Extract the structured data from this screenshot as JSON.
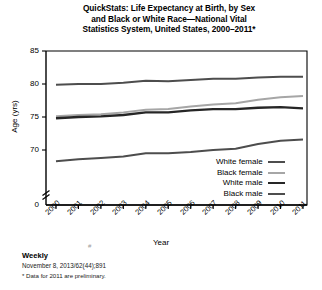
{
  "title": {
    "lines": [
      "QuickStats: Life Expectancy at Birth, by Sex",
      "and Black or White Race—National Vital",
      "Statistics System, United States, 2000–2011*"
    ]
  },
  "footer": {
    "weekly": "Weekly",
    "citation": "November 8, 2013/62(44);891",
    "note": "* Data for 2011 are preliminary."
  },
  "chart_data": {
    "type": "line",
    "title": "QuickStats: Life Expectancy at Birth, by Sex and Black or White Race—National Vital Statistics System, United States, 2000–2011*",
    "xlabel": "Year",
    "ylabel": "Age (yrs)",
    "categories": [
      "2000",
      "2001",
      "2002",
      "2003",
      "2004",
      "2005",
      "2006",
      "2007",
      "2008",
      "2009",
      "2010",
      "2011"
    ],
    "yticks": [
      "0",
      "70",
      "75",
      "80",
      "85"
    ],
    "ylim": [
      66.5,
      85
    ],
    "y_axis_break": true,
    "grid": false,
    "legend_position": "inside-lower-right",
    "series": [
      {
        "name": "White female",
        "color": "#4d4d4d",
        "width": 2.0,
        "values": [
          79.9,
          80.0,
          80.0,
          80.2,
          80.5,
          80.4,
          80.6,
          80.8,
          80.8,
          81.0,
          81.1,
          81.1
        ]
      },
      {
        "name": "Black female",
        "color": "#a6a6a6",
        "width": 2.0,
        "values": [
          75.1,
          75.3,
          75.4,
          75.7,
          76.1,
          76.2,
          76.6,
          76.9,
          77.1,
          77.6,
          78.0,
          78.2
        ]
      },
      {
        "name": "White male",
        "color": "#262626",
        "width": 2.4,
        "values": [
          74.8,
          75.0,
          75.1,
          75.3,
          75.7,
          75.7,
          76.0,
          76.2,
          76.2,
          76.4,
          76.5,
          76.3
        ]
      },
      {
        "name": "Black male",
        "color": "#4d4d4d",
        "width": 2.0,
        "values": [
          68.3,
          68.6,
          68.8,
          69.0,
          69.5,
          69.5,
          69.7,
          70.0,
          70.2,
          70.9,
          71.4,
          71.6
        ]
      }
    ]
  }
}
